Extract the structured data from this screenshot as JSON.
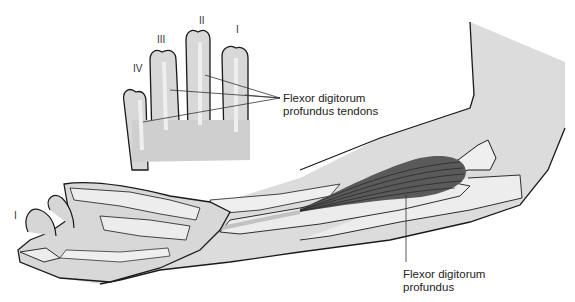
{
  "figure": {
    "colors": {
      "skin": "#dcdcdc",
      "skin_light": "#e6e6e6",
      "bone": "#efefef",
      "tendon": "#c2c2c2",
      "muscle": "#5a5a5a",
      "outline": "#1a1a1a",
      "leader": "#333333"
    }
  },
  "inset": {
    "finger_numerals": [
      {
        "id": "I",
        "label": "I"
      },
      {
        "id": "II",
        "label": "II"
      },
      {
        "id": "III",
        "label": "III"
      },
      {
        "id": "IV",
        "label": "IV"
      }
    ],
    "tendons_label_line1": "Flexor digitorum",
    "tendons_label_line2": "profundus tendons"
  },
  "main": {
    "thumb_numeral": "I",
    "muscle_label_line1": "Flexor digitorum",
    "muscle_label_line2": "profundus"
  }
}
